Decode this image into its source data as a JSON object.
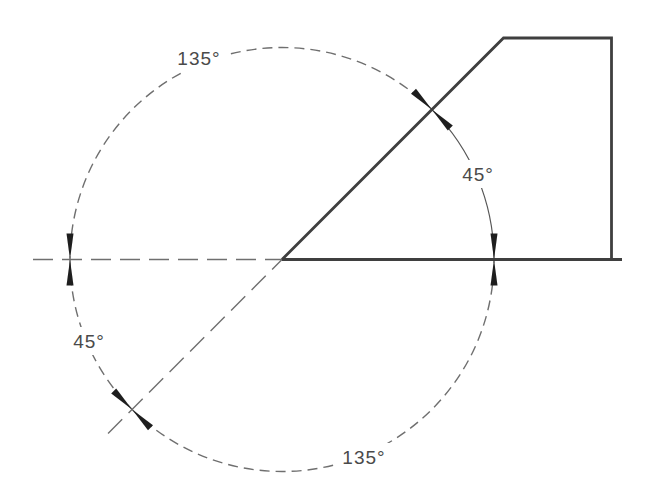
{
  "diagram": {
    "kind": "engineering-angle-drawing",
    "background_color": "#ffffff",
    "outline_color": "#3f3f3f",
    "construction_color": "#6f6f6f",
    "dimension_color": "#575757",
    "arrow_color": "#1e1e1e",
    "text_color": "#4a4a4a",
    "labels": {
      "top_arc": "135°",
      "right_arc": "45°",
      "left_arc": "45°",
      "bottom_arc": "135°"
    },
    "angles_deg": {
      "top_arc": 135,
      "right_arc": 45,
      "left_arc": 45,
      "bottom_arc": 135
    }
  }
}
